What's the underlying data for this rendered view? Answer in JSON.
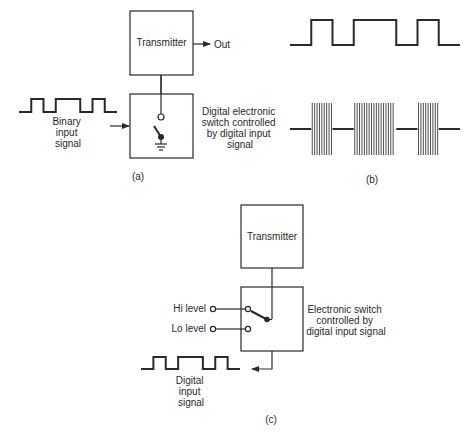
{
  "panel_a": {
    "caption": "(a)",
    "transmitter_label": "Transmitter",
    "output_label": "Out",
    "input_signal_label": [
      "Binary",
      "input",
      "signal"
    ],
    "switch_label": [
      "Digital electronic",
      "switch controlled",
      "by digital input",
      "signal"
    ],
    "input_bits": [
      0,
      1,
      0,
      1,
      1,
      0,
      1,
      0
    ]
  },
  "panel_b": {
    "caption": "(b)",
    "digital_bits": [
      0,
      1,
      0,
      1,
      1,
      0,
      1,
      0
    ],
    "modulated_description": "carrier bursts during high bits"
  },
  "panel_c": {
    "caption": "(c)",
    "transmitter_label": "Transmitter",
    "hi_label": "Hi level",
    "lo_label": "Lo level",
    "switch_label": [
      "Electronic switch",
      "controlled by",
      "digital input signal"
    ],
    "input_signal_label": [
      "Digital",
      "input",
      "signal"
    ],
    "input_bits": [
      0,
      1,
      0,
      1,
      1,
      0,
      1,
      0
    ]
  },
  "colors": {
    "ink": "#2a2a2a",
    "background": "#ffffff"
  }
}
